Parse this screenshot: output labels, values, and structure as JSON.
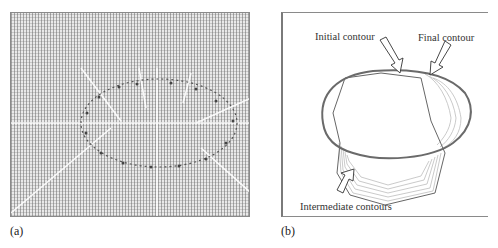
{
  "figure": {
    "panel_a": {
      "caption": "(a)",
      "description": "Gradient vector flow field around an elliptical contour"
    },
    "panel_b": {
      "caption": "(b)",
      "annotations": {
        "initial": "Initial contour",
        "final": "Final contour",
        "intermediate": "Intermediate contours"
      }
    },
    "colors": {
      "field_background": "#e9e9e9",
      "border": "#8a8a8a",
      "contour": "#555555",
      "final_contour": "#6a6a6a"
    }
  }
}
